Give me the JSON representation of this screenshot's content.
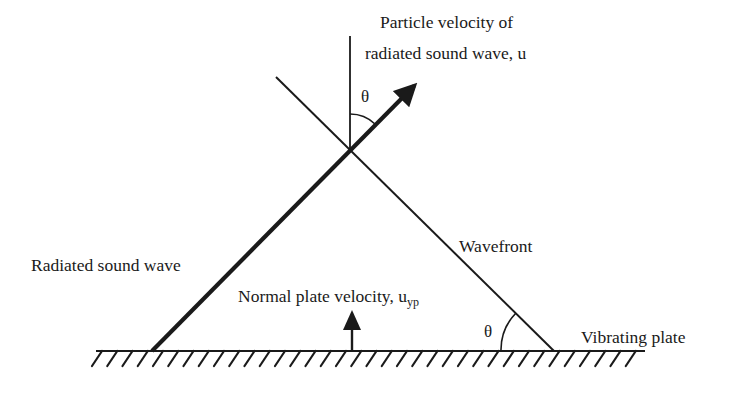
{
  "diagram": {
    "labels": {
      "particle_velocity_line1": "Particle velocity of",
      "particle_velocity_line2": "radiated sound wave, u",
      "radiated_sound_wave": "Radiated sound wave",
      "wavefront": "Wavefront",
      "normal_plate_velocity": "Normal plate velocity, u",
      "normal_plate_velocity_subscript": "yp",
      "vibrating_plate": "Vibrating plate",
      "theta_top": "θ",
      "theta_bottom": "θ"
    },
    "colors": {
      "ink": "#1a1a1a",
      "background": "#ffffff"
    },
    "geometry": {
      "plate": {
        "x1": 96,
        "x2": 645,
        "y": 351,
        "hatch_count": 36,
        "hatch_depth": 15
      },
      "vertical_reference": {
        "x": 350,
        "y_top": 36,
        "y_bottom": 150
      },
      "radiated_wave": {
        "x1": 152,
        "y1": 351,
        "x2": 425,
        "y2": 75
      },
      "wavefront": {
        "x1": 276,
        "y1": 77,
        "x2": 554,
        "y2": 351
      },
      "normal_velocity_arrow": {
        "x": 352,
        "y_base": 351,
        "y_tip": 312
      }
    }
  }
}
